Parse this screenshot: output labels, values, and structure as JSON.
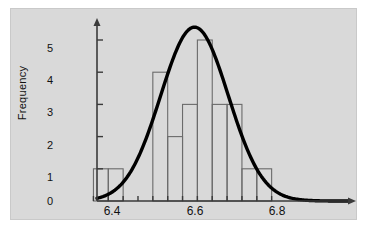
{
  "figure": {
    "background_color": "#d9d9d9",
    "axis_color": "#3a3a3a",
    "bar_edge_color": "#6b6b6b",
    "curve_color": "#000000"
  },
  "axes": {
    "ylabel": "Frequency",
    "xlabel": "",
    "ytick_labels": [
      "0",
      "1",
      "2",
      "3",
      "4",
      "5"
    ],
    "xtick_labels": [
      "6.4",
      "6.6",
      "6.8"
    ]
  },
  "chart_data": {
    "type": "bar",
    "title": "",
    "xlabel": "",
    "ylabel": "Frequency",
    "grid": false,
    "legend": null,
    "xlim": [
      6.29,
      6.95
    ],
    "ylim": [
      0,
      5.6
    ],
    "ytick_values": [
      0,
      1,
      2,
      3,
      4,
      5
    ],
    "xtick_values": [
      6.4,
      6.6,
      6.8
    ],
    "bin_width": 0.036,
    "bin_edges": [
      6.355,
      6.391,
      6.427,
      6.463,
      6.499,
      6.535,
      6.571,
      6.607,
      6.643,
      6.679,
      6.715,
      6.751,
      6.787
    ],
    "categories": [
      "6.355-6.391",
      "6.391-6.427",
      "6.427-6.463",
      "6.463-6.499",
      "6.499-6.535",
      "6.535-6.571",
      "6.571-6.607",
      "6.607-6.643",
      "6.643-6.679",
      "6.679-6.715",
      "6.715-6.751",
      "6.751-6.787"
    ],
    "values": [
      1,
      1,
      0,
      0,
      4,
      2,
      3,
      5,
      3,
      3,
      1,
      1
    ],
    "overlay": {
      "type": "line",
      "name": "normal curve",
      "mean": 6.6,
      "sigma": 0.082,
      "peak_value": 5.4
    }
  }
}
